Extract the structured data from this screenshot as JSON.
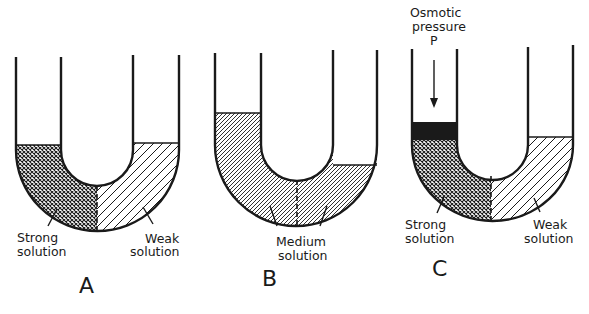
{
  "figure": {
    "panels": [
      {
        "id": "A",
        "label": "A",
        "left_label": [
          "Strong",
          "solution"
        ],
        "right_label": [
          "Weak",
          "solution"
        ],
        "left_fill": "crosshatch",
        "right_fill": "diagonal"
      },
      {
        "id": "B",
        "label": "B",
        "center_label": [
          "Medium",
          "solution"
        ],
        "fill": "fine-diagonal"
      },
      {
        "id": "C",
        "label": "C",
        "top_label": [
          "Osmotic",
          "pressure",
          "P"
        ],
        "left_label": [
          "Strong",
          "solution"
        ],
        "right_label": [
          "Weak",
          "solution"
        ],
        "left_fill": "crosshatch",
        "right_fill": "diagonal",
        "piston": "black"
      }
    ],
    "colors": {
      "ink": "#1a1a1a",
      "background": "#ffffff"
    }
  }
}
